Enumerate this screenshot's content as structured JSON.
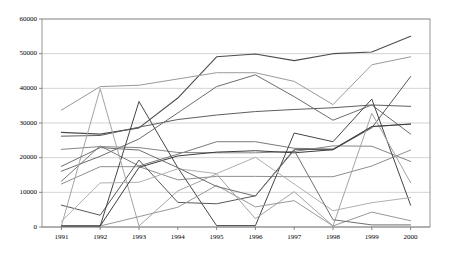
{
  "chart_data": {
    "type": "line",
    "title": "",
    "xlabel": "",
    "ylabel": "",
    "grid": true,
    "legend": "none",
    "ylim": [
      0,
      60000
    ],
    "yticks": [
      0,
      10000,
      20000,
      30000,
      40000,
      50000,
      60000
    ],
    "ytick_labels": [
      "0",
      "10000",
      "20000",
      "30000",
      "40000",
      "50000",
      "60000"
    ],
    "categories": [
      "1991",
      "1992",
      "1993",
      "1994",
      "1995",
      "1996",
      "1997",
      "1998",
      "1999",
      "2000"
    ],
    "x": [
      1991,
      1992,
      1993,
      1994,
      1995,
      1996,
      1997,
      1998,
      1999,
      2000
    ],
    "series": [
      {
        "name": "series-1",
        "color": "#4d4d4d",
        "width": 1.1,
        "values": [
          27300,
          26800,
          28600,
          37200,
          49100,
          49900,
          48000,
          50000,
          50500,
          55000
        ]
      },
      {
        "name": "series-2",
        "color": "#9a9a9a",
        "width": 1.0,
        "values": [
          33700,
          40500,
          40900,
          42700,
          44500,
          44500,
          42000,
          35300,
          46800,
          49100
        ]
      },
      {
        "name": "series-3",
        "color": "#5e5e5e",
        "width": 1.0,
        "values": [
          26200,
          26400,
          28800,
          31000,
          32300,
          33300,
          33900,
          34400,
          35200,
          34800
        ]
      },
      {
        "name": "series-4",
        "color": "#6d6d6d",
        "width": 1.0,
        "values": [
          16100,
          20400,
          25400,
          32900,
          40500,
          43900,
          37600,
          30800,
          35200,
          26800
        ]
      },
      {
        "name": "series-5",
        "color": "#7a7a7a",
        "width": 1.0,
        "values": [
          13200,
          23400,
          17600,
          21000,
          24600,
          24600,
          22700,
          22500,
          28900,
          29700
        ]
      },
      {
        "name": "series-6",
        "color": "#868686",
        "width": 1.0,
        "values": [
          22400,
          23200,
          22900,
          21500,
          21400,
          21400,
          21800,
          23400,
          23300,
          18900
        ]
      },
      {
        "name": "series-7",
        "color": "#8f8f8f",
        "width": 1.0,
        "values": [
          12400,
          17400,
          17400,
          13600,
          14600,
          14600,
          14500,
          14500,
          17600,
          22200
        ]
      },
      {
        "name": "series-8",
        "color": "#585858",
        "width": 1.0,
        "values": [
          6300,
          3400,
          19300,
          7100,
          6700,
          9000,
          22400,
          22300,
          28600,
          43400
        ]
      },
      {
        "name": "series-9",
        "color": "#454545",
        "width": 1.0,
        "values": [
          300,
          300,
          36200,
          17100,
          400,
          400,
          27100,
          24600,
          36900,
          6300
        ]
      },
      {
        "name": "series-10",
        "color": "#a4a4a4",
        "width": 1.0,
        "values": [
          300,
          39900,
          300,
          10400,
          15300,
          2400,
          10200,
          300,
          32800,
          12800
        ]
      },
      {
        "name": "series-11",
        "color": "#b0b0b0",
        "width": 1.0,
        "values": [
          1600,
          12700,
          12900,
          16800,
          15400,
          20100,
          12400,
          4700,
          7000,
          8500
        ]
      },
      {
        "name": "series-12",
        "color": "#999999",
        "width": 1.0,
        "values": [
          300,
          300,
          3000,
          5700,
          12000,
          5800,
          7600,
          300,
          4300,
          1800
        ]
      },
      {
        "name": "series-13",
        "color": "#3b3b3b",
        "width": 1.0,
        "values": [
          300,
          300,
          17200,
          20500,
          21600,
          22000,
          21400,
          22300,
          29000,
          29700
        ]
      },
      {
        "name": "series-14",
        "color": "#707070",
        "width": 1.0,
        "values": [
          17500,
          22900,
          22200,
          17100,
          11700,
          8900,
          22100,
          2100,
          600,
          600
        ]
      }
    ]
  },
  "axes": {
    "plot_left": 42,
    "plot_right": 430,
    "plot_top": 19,
    "plot_bottom": 227
  }
}
